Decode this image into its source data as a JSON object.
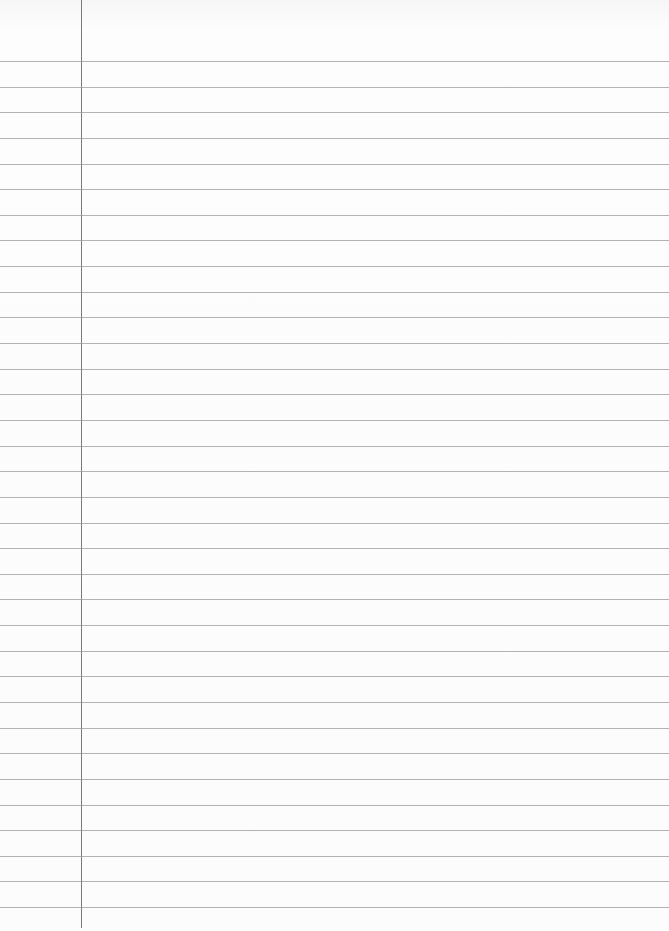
{
  "paper": {
    "type": "ruled notebook paper",
    "width": 669,
    "height": 931,
    "background_color": "#fbfbfb",
    "rule_color": "#9a9a9a",
    "margin_color": "#7a7a7a",
    "margin_x": 81,
    "first_rule_y": 61,
    "rule_spacing": 25.64,
    "rule_count": 34,
    "text": ""
  }
}
